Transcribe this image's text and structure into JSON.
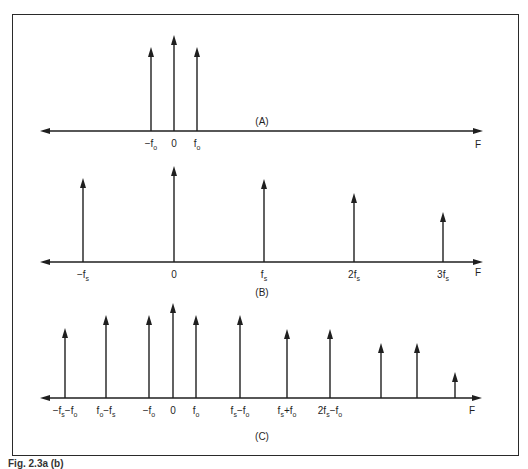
{
  "figure": {
    "caption": "Fig. 2.3a (b)"
  },
  "panels": [
    {
      "id": "A",
      "label": "(A)",
      "axis_label": "F",
      "axis": {
        "y": 131,
        "x_start": 40,
        "x_end": 483
      },
      "label_pos": {
        "x": 262,
        "y": 125
      },
      "axis_label_pos": {
        "x": 478,
        "y": 148
      },
      "impulses": [
        {
          "x": 151,
          "top": 47,
          "label": "-f",
          "sub": "o"
        },
        {
          "x": 174,
          "top": 35,
          "label": "0",
          "sub": ""
        },
        {
          "x": 197,
          "top": 47,
          "label": "f",
          "sub": "o"
        }
      ]
    },
    {
      "id": "B",
      "label": "(B)",
      "axis_label": "F",
      "axis": {
        "y": 262,
        "x_start": 40,
        "x_end": 483
      },
      "label_pos": {
        "x": 262,
        "y": 296
      },
      "axis_label_pos": {
        "x": 478,
        "y": 276
      },
      "impulses": [
        {
          "x": 83,
          "top": 178,
          "label": "-f",
          "sub": "s"
        },
        {
          "x": 174,
          "top": 166,
          "label": "0",
          "sub": ""
        },
        {
          "x": 264,
          "top": 179,
          "label": "f",
          "sub": "s"
        },
        {
          "x": 354,
          "top": 193,
          "label": "2f",
          "sub": "s"
        },
        {
          "x": 443,
          "top": 212,
          "label": "3f",
          "sub": "s"
        }
      ]
    },
    {
      "id": "C",
      "label": "(C)",
      "axis_label": "F",
      "axis": {
        "y": 398,
        "x_start": 40,
        "x_end": 482
      },
      "label_pos": {
        "x": 262,
        "y": 440
      },
      "axis_label_pos": {
        "x": 472,
        "y": 414
      },
      "impulses": [
        {
          "x": 65,
          "top": 328,
          "label": "-f",
          "sub": "s",
          "label2": "-f",
          "sub2": "o"
        },
        {
          "x": 106,
          "top": 315,
          "label": "f",
          "sub": "o",
          "label2": "-f",
          "sub2": "s"
        },
        {
          "x": 149,
          "top": 315,
          "label": "-f",
          "sub": "o"
        },
        {
          "x": 173,
          "top": 303,
          "label": "0",
          "sub": ""
        },
        {
          "x": 196,
          "top": 315,
          "label": "f",
          "sub": "o"
        },
        {
          "x": 240,
          "top": 315,
          "label": "f",
          "sub": "s",
          "label2": "-f",
          "sub2": "o"
        },
        {
          "x": 287,
          "top": 329,
          "label": "f",
          "sub": "s",
          "label2": "+f",
          "sub2": "o"
        },
        {
          "x": 330,
          "top": 329,
          "label": "2f",
          "sub": "s",
          "label2": "-f",
          "sub2": "o"
        },
        {
          "x": 381,
          "top": 343,
          "label": "",
          "sub": ""
        },
        {
          "x": 417,
          "top": 343,
          "label": "",
          "sub": ""
        },
        {
          "x": 455,
          "top": 372,
          "label": "",
          "sub": ""
        }
      ]
    }
  ],
  "colors": {
    "ink": "#1f1f1f",
    "background": "#ffffff",
    "frame": "#2a2a2a"
  }
}
